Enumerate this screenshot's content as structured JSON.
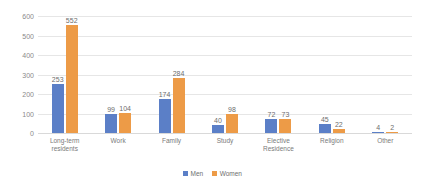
{
  "chart_data": {
    "type": "bar",
    "title": "",
    "xlabel": "",
    "ylabel": "",
    "ylim": [
      0,
      600
    ],
    "ytick_step": 100,
    "grid": true,
    "legend_position": "bottom-center",
    "categories": [
      "Long-term\nresidents",
      "Work",
      "Family",
      "Study",
      "Elective\nResidence",
      "Religion",
      "Other"
    ],
    "yticks": [
      "0",
      "100",
      "200",
      "300",
      "400",
      "500",
      "600"
    ],
    "series": [
      {
        "name": "Men",
        "color": "#5b7fc7",
        "values": [
          253,
          99,
          174,
          40,
          72,
          45,
          4
        ]
      },
      {
        "name": "Women",
        "color": "#ed9b47",
        "values": [
          552,
          104,
          284,
          98,
          73,
          22,
          2
        ]
      }
    ]
  },
  "legend": {
    "men_label": "Men",
    "women_label": "Women"
  }
}
